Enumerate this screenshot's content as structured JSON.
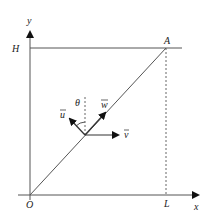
{
  "diagram": {
    "labels": {
      "y_axis": "y",
      "x_axis": "x",
      "height": "H",
      "length": "L",
      "origin": "O",
      "point_a": "A",
      "angle": "θ",
      "vec_u": "u",
      "vec_v": "v",
      "vec_w": "w"
    },
    "colors": {
      "line": "#444444",
      "text": "#222222"
    }
  }
}
